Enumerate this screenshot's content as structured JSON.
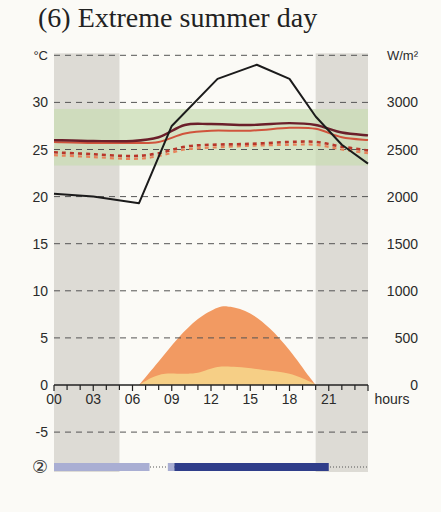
{
  "title": "(6) Extreme summer day",
  "chart_data": {
    "type": "line",
    "title": "(6) Extreme summer day",
    "xlabel": "hours",
    "ylabel_left": "°C",
    "ylabel_right": "W/m²",
    "x_ticks": [
      "00",
      "03",
      "06",
      "09",
      "12",
      "15",
      "18",
      "21"
    ],
    "x_range": [
      0,
      24
    ],
    "y_left_ticks": [
      -5,
      0,
      5,
      10,
      15,
      20,
      25,
      30
    ],
    "y_right_ticks": [
      0,
      500,
      1000,
      1500,
      2000,
      2500,
      3000
    ],
    "ylim_left": [
      -5,
      35
    ],
    "ylim_right": [
      0,
      3500
    ],
    "grid": "dashed horizontal",
    "night_bands_hours": [
      [
        0,
        5
      ],
      [
        20,
        24
      ]
    ],
    "comfort_band_celsius": [
      23.3,
      29.3
    ],
    "series": [
      {
        "name": "outdoor temperature",
        "style": "solid black",
        "unit": "°C",
        "x": [
          0,
          3,
          6.5,
          9,
          12.5,
          15.5,
          18,
          20,
          22,
          24
        ],
        "values": [
          20.3,
          20.0,
          19.3,
          27.5,
          32.5,
          34.0,
          32.5,
          28.5,
          25.5,
          23.5
        ]
      },
      {
        "name": "indoor temperature (dark)",
        "style": "solid dark red",
        "unit": "°C",
        "x": [
          0,
          3,
          6,
          8,
          10,
          12,
          15,
          18,
          20,
          22,
          24
        ],
        "values": [
          26.0,
          25.9,
          25.9,
          26.3,
          27.6,
          27.7,
          27.6,
          27.8,
          27.6,
          26.8,
          26.5
        ]
      },
      {
        "name": "indoor temperature (red)",
        "style": "solid red",
        "unit": "°C",
        "x": [
          0,
          3,
          6,
          8,
          10,
          12,
          15,
          18,
          20,
          22,
          24
        ],
        "values": [
          25.8,
          25.7,
          25.7,
          25.8,
          26.7,
          27.0,
          27.0,
          27.3,
          27.2,
          26.3,
          26.0
        ]
      },
      {
        "name": "indoor temperature (dashed dark red)",
        "style": "dashed dark red",
        "unit": "°C",
        "x": [
          0,
          3,
          6,
          8,
          10,
          12,
          15,
          18,
          20,
          22,
          24
        ],
        "values": [
          24.7,
          24.5,
          24.3,
          24.6,
          25.3,
          25.5,
          25.6,
          25.8,
          25.8,
          25.3,
          24.9
        ]
      },
      {
        "name": "indoor temperature (dashed orange)",
        "style": "dashed orange",
        "unit": "°C",
        "x": [
          0,
          3,
          6,
          8,
          10,
          12,
          15,
          18,
          20,
          22,
          24
        ],
        "values": [
          24.4,
          24.2,
          24.0,
          24.3,
          25.0,
          25.2,
          25.4,
          25.5,
          25.5,
          25.0,
          24.6
        ]
      },
      {
        "name": "total solar irradiance",
        "style": "area orange",
        "unit": "W/m²",
        "x": [
          6.5,
          8,
          9.5,
          11,
          12.5,
          13.5,
          15,
          16.5,
          18,
          19.5,
          20
        ],
        "values": [
          0,
          250,
          500,
          700,
          820,
          830,
          760,
          600,
          370,
          90,
          0
        ]
      },
      {
        "name": "diffuse solar irradiance",
        "style": "area light yellow",
        "unit": "W/m²",
        "x": [
          6.5,
          7.5,
          8.5,
          10,
          11,
          12.5,
          14,
          16,
          18,
          19.5,
          20
        ],
        "values": [
          0,
          80,
          120,
          120,
          130,
          190,
          190,
          160,
          120,
          40,
          0
        ]
      }
    ],
    "schedule_bar": {
      "label": "②",
      "segments": [
        {
          "from": 0,
          "to": 7.3,
          "style": "light blue"
        },
        {
          "from": 8.7,
          "to": 9.2,
          "style": "light blue"
        },
        {
          "from": 9.2,
          "to": 21,
          "style": "dark blue"
        }
      ],
      "dotted_baseline": [
        0,
        24
      ]
    },
    "colors": {
      "night_band": "#d9d7d1",
      "comfort_band": "#c9dcb4",
      "outdoor": "#1b1b1b",
      "indoor_dark": "#6b1f2a",
      "indoor_red": "#d0543c",
      "indoor_dashed_dark": "#b8362a",
      "indoor_dashed_orange": "#e8835a",
      "total_irradiance": "#f29a62",
      "diffuse_irradiance": "#f6cf86",
      "schedule_light": "#a9aed3",
      "schedule_dark": "#2f3d8a"
    }
  }
}
